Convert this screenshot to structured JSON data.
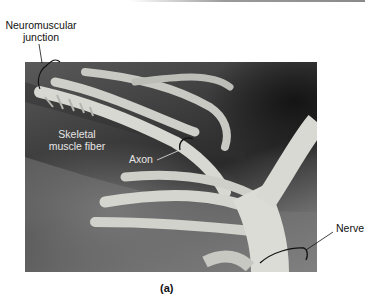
{
  "figure": {
    "panel_label": "(a)",
    "labels": {
      "neuromuscular_junction": [
        "Neuromuscular",
        "junction"
      ],
      "skeletal_muscle_fiber": [
        "Skeletal",
        "muscle fiber"
      ],
      "axon": "Axon",
      "nerve": "Nerve"
    },
    "colors": {
      "label_dark": "#111111",
      "label_light": "#e6e6e6",
      "nerve_tissue": "#d9d9d4",
      "background_dark": "#2a2a2a"
    }
  }
}
